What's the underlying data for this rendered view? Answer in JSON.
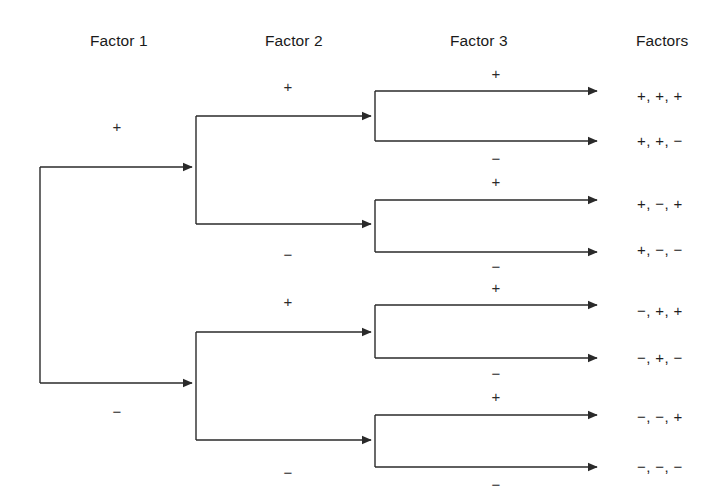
{
  "diagram": {
    "line_color": "#2a2a2a",
    "background_color": "#ffffff",
    "text_color": "#1a1a1a"
  },
  "headers": [
    {
      "label": "Factor 1",
      "x": 90,
      "y": 42
    },
    {
      "label": "Factor 2",
      "x": 265,
      "y": 42
    },
    {
      "label": "Factor 3",
      "x": 450,
      "y": 42
    },
    {
      "label": "Factors",
      "x": 636,
      "y": 42
    }
  ],
  "signs": {
    "factor1": [
      {
        "value": "+",
        "x": 117,
        "y": 126
      },
      {
        "value": "−",
        "x": 117,
        "y": 411
      }
    ],
    "factor2": [
      {
        "value": "+",
        "x": 288,
        "y": 86
      },
      {
        "value": "−",
        "x": 288,
        "y": 254
      },
      {
        "value": "+",
        "x": 288,
        "y": 301
      },
      {
        "value": "−",
        "x": 288,
        "y": 472
      }
    ],
    "factor3": [
      {
        "value": "+",
        "x": 496,
        "y": 73
      },
      {
        "value": "−",
        "x": 496,
        "y": 158
      },
      {
        "value": "+",
        "x": 496,
        "y": 181
      },
      {
        "value": "−",
        "x": 496,
        "y": 266
      },
      {
        "value": "+",
        "x": 496,
        "y": 287
      },
      {
        "value": "−",
        "x": 496,
        "y": 373
      },
      {
        "value": "+",
        "x": 496,
        "y": 396
      },
      {
        "value": "−",
        "x": 496,
        "y": 484
      }
    ]
  },
  "outcomes": [
    {
      "label": "+, +, +",
      "y": 95,
      "x": 637
    },
    {
      "label": "+, +, −",
      "y": 140,
      "x": 637
    },
    {
      "label": "+, −, +",
      "y": 203,
      "x": 637
    },
    {
      "label": "+, −, −",
      "y": 249,
      "x": 637
    },
    {
      "label": "−, +, +",
      "y": 310,
      "x": 637
    },
    {
      "label": "−, +, −",
      "y": 357,
      "x": 637
    },
    {
      "label": "−, −, +",
      "y": 416,
      "x": 637
    },
    {
      "label": "−, −, −",
      "y": 466,
      "x": 637
    }
  ],
  "geometry": {
    "root_x": 40,
    "root_top_y": 167,
    "root_bottom_y": 383,
    "f2_trunk_x": 196,
    "f2_branches": [
      {
        "trunk_in_y": 167,
        "top_y": 116,
        "bottom_y": 224
      },
      {
        "trunk_in_y": 383,
        "top_y": 332,
        "bottom_y": 440
      }
    ],
    "f3_trunk_x": 375,
    "f3_arrow_end_x": 601,
    "f3_branches": [
      {
        "trunk_in_y": 116,
        "top_y": 91,
        "bottom_y": 141
      },
      {
        "trunk_in_y": 224,
        "top_y": 200,
        "bottom_y": 252
      },
      {
        "trunk_in_y": 332,
        "top_y": 305,
        "bottom_y": 358
      },
      {
        "trunk_in_y": 440,
        "top_y": 415,
        "bottom_y": 467
      }
    ]
  }
}
